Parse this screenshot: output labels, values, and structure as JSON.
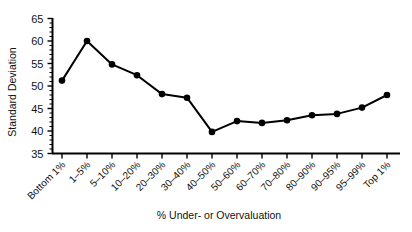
{
  "chart_data": {
    "type": "line",
    "title": "",
    "xlabel": "% Under- or Overvaluation",
    "ylabel": "Standard Deviation",
    "ylim": [
      35,
      65
    ],
    "ytick_labels": [
      "65",
      "60",
      "55",
      "50",
      "45",
      "40",
      "35"
    ],
    "ytick_values": [
      65,
      60,
      55,
      50,
      45,
      40,
      35
    ],
    "minor_ticks": true,
    "grid": false,
    "legend": null,
    "categories": [
      "Bottom 1%",
      "1–5%",
      "5–10%",
      "10–20%",
      "20–30%",
      "30–40%",
      "40–50%",
      "50–60%",
      "60–70%",
      "70–80%",
      "80–90%",
      "90–95%",
      "95–99%",
      "Top 1%"
    ],
    "values": [
      51.2,
      60.0,
      54.8,
      52.4,
      48.2,
      47.4,
      39.8,
      42.2,
      41.8,
      42.4,
      43.5,
      43.8,
      45.2,
      48.0
    ],
    "series": [
      {
        "name": "Standard Deviation",
        "marker": "filled-circle",
        "color": "#000000",
        "values": [
          51.2,
          60.0,
          54.8,
          52.4,
          48.2,
          47.4,
          39.8,
          42.2,
          41.8,
          42.4,
          43.5,
          43.8,
          45.2,
          48.0
        ]
      }
    ]
  },
  "colors": {
    "line": "#000000",
    "marker": "#000000",
    "axis": "#000000",
    "background": "#ffffff"
  }
}
